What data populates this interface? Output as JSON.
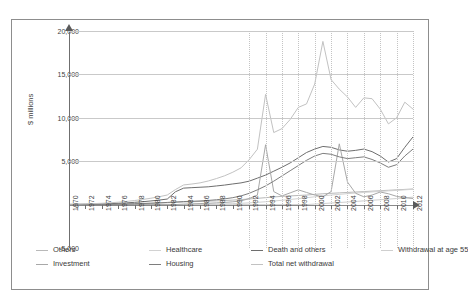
{
  "chart_data": {
    "type": "line",
    "title": "",
    "xlabel": "",
    "ylabel": "$ millions",
    "ylim": [
      -5000,
      20000
    ],
    "yticks": [
      "20,000",
      "15,000",
      "10,000",
      "5,000",
      "0",
      "-5,000"
    ],
    "ytick_values": [
      20000,
      15000,
      10000,
      5000,
      0,
      -5000
    ],
    "xlim": [
      1970,
      2012
    ],
    "xticks": [
      "1970",
      "1972",
      "1974",
      "1976",
      "1978",
      "1980",
      "1982",
      "1984",
      "1986",
      "1988",
      "1990",
      "1992",
      "1994",
      "1996",
      "1998",
      "2000",
      "2002",
      "2004",
      "2006",
      "2008",
      "2010",
      "2012"
    ],
    "grid": "horizontal-solid-and-vertical-dotted",
    "legend_position": "bottom",
    "x": [
      1970,
      1971,
      1972,
      1973,
      1974,
      1975,
      1976,
      1977,
      1978,
      1979,
      1980,
      1981,
      1982,
      1983,
      1984,
      1985,
      1986,
      1987,
      1988,
      1989,
      1990,
      1991,
      1992,
      1993,
      1994,
      1995,
      1996,
      1997,
      1998,
      1999,
      2000,
      2001,
      2002,
      2003,
      2004,
      2005,
      2006,
      2007,
      2008,
      2009,
      2010,
      2011,
      2012
    ],
    "series": [
      {
        "name": "Others",
        "color": "#b9b9b9",
        "values": [
          10,
          15,
          20,
          30,
          40,
          55,
          70,
          90,
          110,
          130,
          150,
          180,
          210,
          250,
          300,
          330,
          360,
          400,
          430,
          470,
          520,
          580,
          650,
          720,
          800,
          880,
          950,
          1000,
          1050,
          1100,
          1180,
          1250,
          1300,
          1350,
          1400,
          1450,
          1500,
          1550,
          1600,
          1650,
          1700,
          1750,
          1800
        ]
      },
      {
        "name": "Healthcare",
        "color": "#d2d2d2",
        "values": [
          0,
          0,
          0,
          0,
          0,
          0,
          0,
          0,
          0,
          0,
          0,
          0,
          0,
          0,
          5,
          10,
          20,
          35,
          55,
          80,
          110,
          150,
          200,
          260,
          330,
          410,
          500,
          590,
          690,
          790,
          900,
          1000,
          1100,
          1180,
          1260,
          1330,
          1400,
          1460,
          1520,
          1580,
          1640,
          1700,
          1760
        ]
      },
      {
        "name": "Death and others",
        "color": "#6e6e6e",
        "values": [
          20,
          30,
          45,
          60,
          80,
          110,
          150,
          200,
          260,
          330,
          420,
          520,
          640,
          1480,
          1900,
          1950,
          2000,
          2050,
          2150,
          2250,
          2380,
          2500,
          2700,
          3050,
          3400,
          3850,
          4300,
          4800,
          5400,
          6000,
          6400,
          6700,
          6600,
          6300,
          6150,
          6250,
          6400,
          6100,
          5600,
          4900,
          5300,
          6600,
          7800
        ]
      },
      {
        "name": "Withdrawal at age 55",
        "color": "#cfcfcf",
        "values": [
          0,
          0,
          0,
          0,
          0,
          0,
          0,
          0,
          0,
          0,
          0,
          0,
          0,
          0,
          0,
          0,
          0,
          0,
          0,
          0,
          0,
          0,
          0,
          0,
          0,
          0,
          0,
          0,
          0,
          0,
          60,
          120,
          180,
          240,
          300,
          360,
          430,
          500,
          560,
          630,
          700,
          780,
          860
        ]
      },
      {
        "name": "Investment",
        "color": "#a8a8a8",
        "values": [
          0,
          0,
          0,
          0,
          0,
          0,
          0,
          0,
          0,
          0,
          0,
          0,
          0,
          0,
          60,
          90,
          120,
          150,
          200,
          250,
          320,
          420,
          700,
          1100,
          6900,
          1500,
          1000,
          1350,
          1700,
          1400,
          1100,
          900,
          1500,
          7000,
          2600,
          1300,
          900,
          1100,
          1450,
          1250,
          950,
          800,
          700
        ]
      },
      {
        "name": "Housing",
        "color": "#7e7e7e",
        "values": [
          5,
          8,
          12,
          18,
          25,
          35,
          50,
          70,
          95,
          125,
          160,
          200,
          250,
          300,
          350,
          380,
          420,
          480,
          560,
          660,
          800,
          1000,
          1300,
          1700,
          2150,
          2700,
          3300,
          3900,
          4500,
          5100,
          5600,
          5900,
          5800,
          5500,
          5300,
          5400,
          5500,
          5200,
          4800,
          4300,
          4600,
          5600,
          6400
        ]
      },
      {
        "name": "Total net withdrawal",
        "color": "#c2c2c2",
        "values": [
          40,
          55,
          80,
          110,
          150,
          205,
          275,
          365,
          470,
          590,
          735,
          905,
          1105,
          1735,
          2265,
          2370,
          2505,
          2720,
          3000,
          3320,
          3730,
          4230,
          5180,
          6380,
          12700,
          8300,
          8750,
          9800,
          11200,
          11600,
          13900,
          18800,
          14400,
          13300,
          12400,
          11200,
          12300,
          12200,
          11000,
          9300,
          10000,
          11800,
          11000
        ]
      }
    ]
  },
  "axis": {
    "y_title": "$ millions"
  },
  "legend": {
    "rows": [
      [
        {
          "label": "Others",
          "color": "#b9b9b9"
        },
        {
          "label": "Healthcare",
          "color": "#d2d2d2"
        },
        {
          "label": "Death and others",
          "color": "#6e6e6e"
        },
        {
          "label": "Withdrawal at age 55",
          "color": "#cfcfcf"
        }
      ],
      [
        {
          "label": "Investment",
          "color": "#a8a8a8"
        },
        {
          "label": "Housing",
          "color": "#7e7e7e"
        },
        {
          "label": "Total net withdrawal",
          "color": "#c2c2c2"
        }
      ]
    ]
  }
}
